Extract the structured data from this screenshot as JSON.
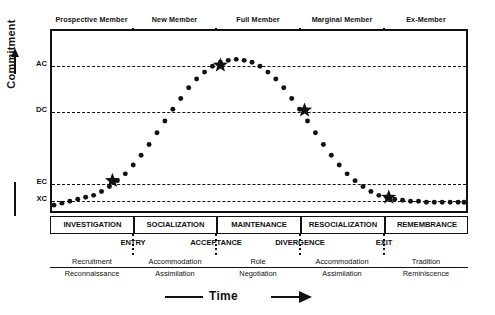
{
  "figure": {
    "x_axis": {
      "label": "Time",
      "arrow": "right-arrow-icon"
    },
    "y_axis": {
      "label": "Commitment",
      "arrow": "up-arrow-icon"
    }
  },
  "membership_phases": [
    {
      "label": "Prospective Member",
      "start": 0,
      "end": 83
    },
    {
      "label": "New Member",
      "start": 83,
      "end": 166
    },
    {
      "label": "Full Member",
      "start": 166,
      "end": 250
    },
    {
      "label": "Marginal Member",
      "start": 250,
      "end": 334
    },
    {
      "label": "Ex-Member",
      "start": 334,
      "end": 418
    }
  ],
  "commitment_levels": [
    {
      "code": "AC",
      "y": 35
    },
    {
      "code": "DC",
      "y": 81
    },
    {
      "code": "EC",
      "y": 153
    },
    {
      "code": "XC",
      "y": 170
    }
  ],
  "process_stages": [
    {
      "label": "INVESTIGATION",
      "start": 0,
      "end": 83
    },
    {
      "label": "SOCIALIZATION",
      "start": 83,
      "end": 166
    },
    {
      "label": "MAINTENANCE",
      "start": 166,
      "end": 250
    },
    {
      "label": "RESOCIALIZATION",
      "start": 250,
      "end": 334
    },
    {
      "label": "REMEMBRANCE",
      "start": 334,
      "end": 418
    }
  ],
  "turning_points": [
    {
      "label": "ENTRY",
      "x": 83
    },
    {
      "label": "ACCEPTANCE",
      "x": 166
    },
    {
      "label": "DIVERGENCE",
      "x": 250
    },
    {
      "label": "EXIT",
      "x": 334
    }
  ],
  "process_pairs": [
    {
      "x": 42,
      "numerator": "Recruitment",
      "denominator": "Reconnaissance"
    },
    {
      "x": 125,
      "numerator": "Accommodation",
      "denominator": "Assimilation"
    },
    {
      "x": 208,
      "numerator": "Role",
      "denominator": "Negotiation"
    },
    {
      "x": 292,
      "numerator": "Accommodation",
      "denominator": "Assimilation"
    },
    {
      "x": 376,
      "numerator": "Tradition",
      "denominator": "Reminiscence"
    }
  ],
  "chart_data": {
    "type": "line",
    "xlabel": "Time",
    "ylabel": "Commitment",
    "style": "dotted",
    "xlim": [
      0,
      418
    ],
    "ylim": [
      184,
      0
    ],
    "grid": "horizontal-dashed-at-commitment-levels",
    "legend": "none",
    "ytick_labels": [
      "AC",
      "DC",
      "EC",
      "XC"
    ],
    "ytick_values": [
      35,
      81,
      153,
      170
    ],
    "xtick_values": [
      83,
      166,
      250,
      334
    ],
    "curve_points": [
      [
        2,
        178
      ],
      [
        10,
        176
      ],
      [
        18,
        174
      ],
      [
        26,
        172
      ],
      [
        34,
        170
      ],
      [
        42,
        168
      ],
      [
        50,
        164
      ],
      [
        58,
        159
      ],
      [
        66,
        153
      ],
      [
        74,
        146
      ],
      [
        82,
        137
      ],
      [
        90,
        127
      ],
      [
        98,
        116
      ],
      [
        106,
        104
      ],
      [
        114,
        92
      ],
      [
        122,
        80
      ],
      [
        130,
        69
      ],
      [
        138,
        58
      ],
      [
        146,
        49
      ],
      [
        154,
        42
      ],
      [
        162,
        36
      ],
      [
        170,
        32
      ],
      [
        178,
        30
      ],
      [
        186,
        29
      ],
      [
        194,
        30
      ],
      [
        202,
        32
      ],
      [
        210,
        36
      ],
      [
        218,
        42
      ],
      [
        226,
        49
      ],
      [
        234,
        58
      ],
      [
        242,
        69
      ],
      [
        250,
        80
      ],
      [
        258,
        92
      ],
      [
        266,
        104
      ],
      [
        274,
        116
      ],
      [
        282,
        127
      ],
      [
        290,
        137
      ],
      [
        298,
        146
      ],
      [
        306,
        153
      ],
      [
        314,
        159
      ],
      [
        322,
        164
      ],
      [
        330,
        168
      ],
      [
        338,
        170
      ],
      [
        346,
        172
      ],
      [
        354,
        173
      ],
      [
        362,
        174
      ],
      [
        370,
        174
      ],
      [
        378,
        175
      ],
      [
        386,
        175
      ],
      [
        394,
        175
      ],
      [
        402,
        175
      ],
      [
        410,
        175
      ],
      [
        416,
        175
      ]
    ],
    "markers": [
      {
        "name": "entry-star",
        "x": 61,
        "y": 153,
        "level": "EC",
        "shape": "star"
      },
      {
        "name": "acceptance-star",
        "x": 170,
        "y": 35,
        "level": "AC",
        "shape": "star"
      },
      {
        "name": "divergence-star",
        "x": 255,
        "y": 81,
        "level": "DC",
        "shape": "star"
      },
      {
        "name": "exit-star",
        "x": 340,
        "y": 170,
        "level": "XC",
        "shape": "star"
      }
    ]
  }
}
